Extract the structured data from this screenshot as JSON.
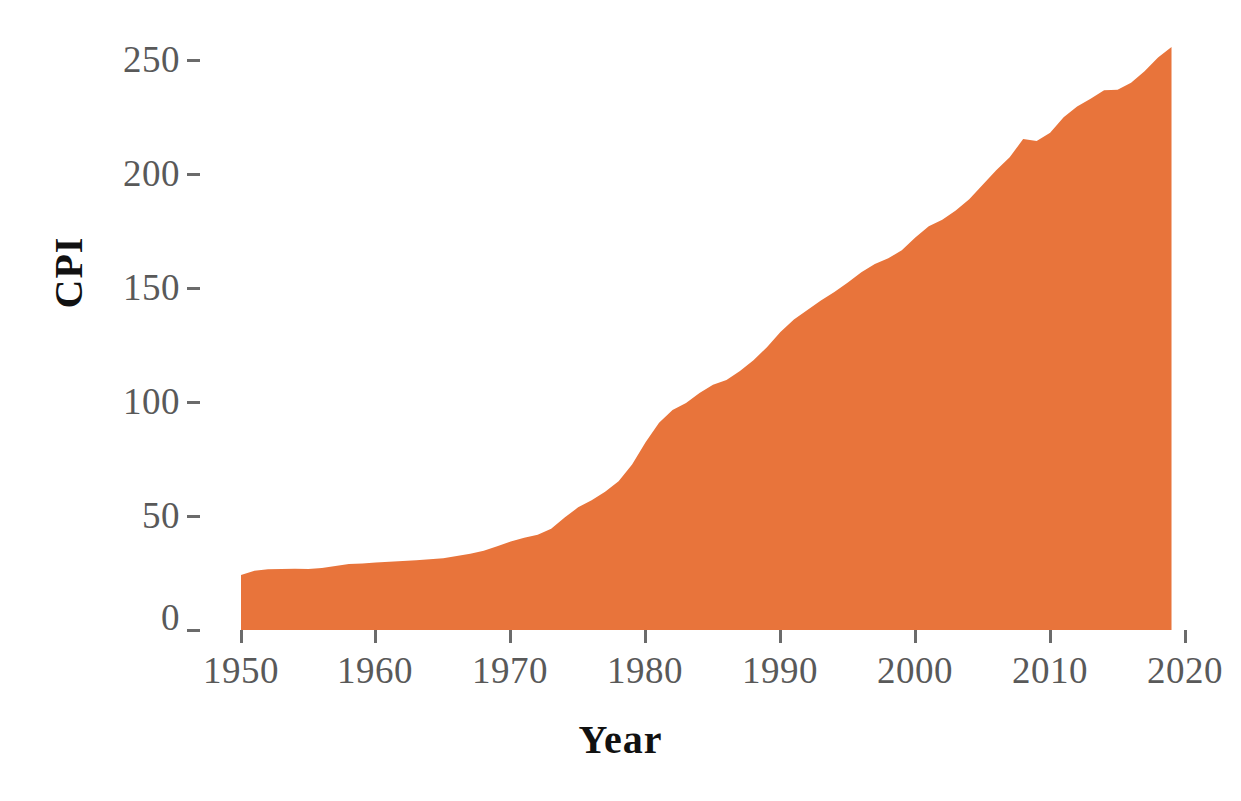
{
  "chart_data": {
    "type": "area",
    "title": "",
    "xlabel": "Year",
    "ylabel": "CPI",
    "xlim": [
      1950,
      2019
    ],
    "ylim": [
      0,
      258
    ],
    "grid": false,
    "legend": null,
    "series_color": "#E8743B",
    "x_ticks": [
      1950,
      1960,
      1970,
      1980,
      1990,
      2000,
      2010,
      2020
    ],
    "x_tick_labels": [
      "1950",
      "1960",
      "1970",
      "1980",
      "1990",
      "2000",
      "2010",
      "2020"
    ],
    "y_ticks": [
      0,
      50,
      100,
      150,
      200,
      250
    ],
    "y_tick_labels": [
      "0",
      "50",
      "100",
      "150",
      "200",
      "250"
    ],
    "series": [
      {
        "name": "CPI",
        "x": [
          1950,
          1951,
          1952,
          1953,
          1954,
          1955,
          1956,
          1957,
          1958,
          1959,
          1960,
          1961,
          1962,
          1963,
          1964,
          1965,
          1966,
          1967,
          1968,
          1969,
          1970,
          1971,
          1972,
          1973,
          1974,
          1975,
          1976,
          1977,
          1978,
          1979,
          1980,
          1981,
          1982,
          1983,
          1984,
          1985,
          1986,
          1987,
          1988,
          1989,
          1990,
          1991,
          1992,
          1993,
          1994,
          1995,
          1996,
          1997,
          1998,
          1999,
          2000,
          2001,
          2002,
          2003,
          2004,
          2005,
          2006,
          2007,
          2008,
          2009,
          2010,
          2011,
          2012,
          2013,
          2014,
          2015,
          2016,
          2017,
          2018,
          2019
        ],
        "values": [
          24.1,
          26.0,
          26.6,
          26.8,
          26.9,
          26.8,
          27.2,
          28.1,
          28.9,
          29.2,
          29.6,
          29.9,
          30.3,
          30.6,
          31.0,
          31.5,
          32.5,
          33.4,
          34.8,
          36.7,
          38.8,
          40.5,
          41.8,
          44.4,
          49.3,
          53.8,
          56.9,
          60.6,
          65.2,
          72.6,
          82.4,
          90.9,
          96.5,
          99.6,
          103.9,
          107.6,
          109.6,
          113.6,
          118.3,
          124.0,
          130.7,
          136.2,
          140.3,
          144.5,
          148.2,
          152.4,
          156.9,
          160.5,
          163.0,
          166.6,
          172.2,
          177.1,
          179.9,
          184.0,
          188.9,
          195.3,
          201.6,
          207.3,
          215.3,
          214.5,
          218.1,
          224.9,
          229.6,
          233.0,
          236.7,
          237.0,
          240.0,
          245.1,
          251.1,
          255.7
        ]
      }
    ]
  },
  "axes": {
    "y_title": "CPI",
    "x_title": "Year"
  }
}
